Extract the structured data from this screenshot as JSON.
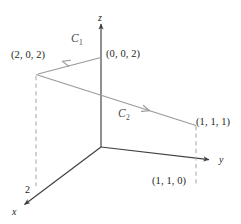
{
  "figure": {
    "background_color": "#ffffff",
    "axis_color": "#3f3f41",
    "curve_color": "#9a9a9a",
    "dashed_color": "#a8a8a8",
    "text_color": "#231f20"
  },
  "axes": [
    {
      "name": "z-axis",
      "label": "z",
      "label_x": 98,
      "label_y": 13
    },
    {
      "name": "y-axis",
      "label": "y",
      "label_x": 219,
      "label_y": 156
    },
    {
      "name": "x-axis",
      "label": "x",
      "label_x": 13,
      "label_y": 208
    }
  ],
  "ticks": [
    {
      "name": "x-axis-tick-2",
      "label": "2",
      "x": 25,
      "y": 186
    }
  ],
  "points": [
    {
      "name": "point-0-0-2",
      "label": "(0, 0, 2)",
      "x": 106,
      "y": 50,
      "px": 101,
      "py": 57
    },
    {
      "name": "point-2-0-2",
      "label": "(2, 0, 2)",
      "x": 11,
      "y": 50,
      "px": 36,
      "py": 74
    },
    {
      "name": "point-1-1-1",
      "label": "(1, 1, 1)",
      "x": 197,
      "y": 118,
      "px": 196,
      "py": 125
    },
    {
      "name": "point-1-1-0",
      "label": "(1, 1, 0)",
      "x": 152,
      "y": 176,
      "px": 196,
      "py": 185
    }
  ],
  "curves": [
    {
      "name": "curve-C1",
      "label": "C",
      "subscript": "1",
      "label_x": 72,
      "label_y": 35,
      "from": "(0, 0, 2)",
      "to": "(2, 0, 2)",
      "direction": "leftward"
    },
    {
      "name": "curve-C2",
      "label": "C",
      "subscript": "2",
      "label_x": 119,
      "label_y": 110,
      "from": "(2, 0, 2)",
      "to": "(1, 1, 1)",
      "direction": "rightward"
    }
  ],
  "origin": {
    "x": 101,
    "y": 147
  }
}
